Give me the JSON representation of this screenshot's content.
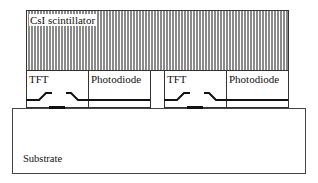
{
  "diagram": {
    "type": "cross-section",
    "layers": {
      "scintillator": {
        "label": "CsI scintillator"
      },
      "substrate": {
        "label": "Substrate"
      }
    },
    "pixels": [
      {
        "tft_label": "TFT",
        "photodiode_label": "Photodiode"
      },
      {
        "tft_label": "TFT",
        "photodiode_label": "Photodiode"
      }
    ],
    "colors": {
      "outline": "#333333",
      "hatch": "#8a8a8a",
      "background": "#ffffff"
    }
  }
}
